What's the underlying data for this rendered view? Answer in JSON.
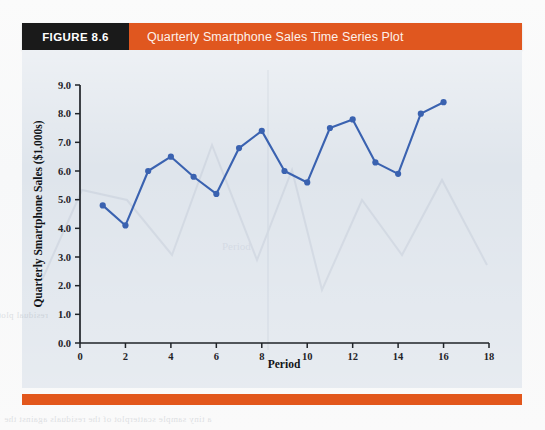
{
  "figure": {
    "tag": "FIGURE 8.6",
    "title": "Quarterly Smartphone Sales Time Series Plot",
    "tag_bg": "#1a1a1a",
    "band_bg": "#e0571f",
    "body_bg": "#dfe5ec",
    "rule_bg": "#e2571c"
  },
  "bleed": {
    "bottom_line": "a tiny sample scatterplot of the residuals against the",
    "left_line": "residual plot"
  },
  "chart_data": {
    "type": "line",
    "title": "Quarterly Smartphone Sales Time Series Plot",
    "xlabel": "Period",
    "ylabel": "Quarterly Smartphone Sales ($1,000s)",
    "xlim": [
      0,
      18
    ],
    "ylim": [
      0,
      9
    ],
    "xticks": [
      0,
      2,
      4,
      6,
      8,
      10,
      12,
      14,
      16,
      18
    ],
    "xtick_labels": [
      "0",
      "2",
      "4",
      "6",
      "8",
      "10",
      "12",
      "14",
      "16",
      "18"
    ],
    "yticks": [
      0,
      1,
      2,
      3,
      4,
      5,
      6,
      7,
      8,
      9
    ],
    "ytick_labels": [
      "0.0",
      "1.0",
      "2.0",
      "3.0",
      "4.0",
      "5.0",
      "6.0",
      "7.0",
      "8.0",
      "9.0"
    ],
    "grid": false,
    "legend": null,
    "marker": "circle",
    "line_color": "#3a62b0",
    "marker_color": "#3a62b0",
    "x": [
      1,
      2,
      3,
      4,
      5,
      6,
      7,
      8,
      9,
      10,
      11,
      12,
      13,
      14,
      15,
      16
    ],
    "values": [
      4.8,
      4.1,
      6.0,
      6.5,
      5.8,
      5.2,
      6.8,
      7.4,
      6.0,
      5.6,
      7.5,
      7.8,
      6.3,
      5.9,
      8.0,
      8.4
    ],
    "series": [
      {
        "name": "Quarterly Smartphone Sales",
        "values": [
          4.8,
          4.1,
          6.0,
          6.5,
          5.8,
          5.2,
          6.8,
          7.4,
          6.0,
          5.6,
          7.5,
          7.8,
          6.3,
          5.9,
          8.0,
          8.4
        ]
      }
    ]
  }
}
